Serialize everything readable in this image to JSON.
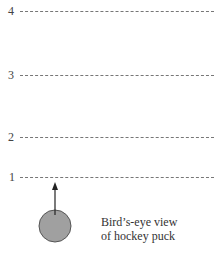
{
  "diagram": {
    "lines": [
      {
        "label": "4",
        "y": 11
      },
      {
        "label": "3",
        "y": 75
      },
      {
        "label": "2",
        "y": 137
      },
      {
        "label": "1",
        "y": 177
      }
    ],
    "puck": {
      "color": "#a0a0a0",
      "stroke": "#555555"
    },
    "caption": {
      "line1": "Bird’s-eye view",
      "line2": "of hockey puck"
    }
  }
}
